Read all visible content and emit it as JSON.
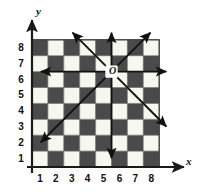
{
  "figure": {
    "axes": {
      "x_axis_label": "x",
      "y_axis_label": "y",
      "x_ticks": [
        "1",
        "2",
        "3",
        "4",
        "5",
        "6",
        "7",
        "8"
      ],
      "y_ticks": [
        "1",
        "2",
        "3",
        "4",
        "5",
        "6",
        "7",
        "8"
      ]
    },
    "origin_point": {
      "label": "O",
      "x": 5,
      "y": 6
    },
    "colors": {
      "dark_square": "#4a4a4a",
      "light_square": "#f7f7f2",
      "grid_line": "#6b6b6b",
      "axis": "#1a1a1a",
      "arrow": "#111111",
      "background": "#ffffff"
    }
  },
  "chart_data": {
    "type": "scatter",
    "xlabel": "x",
    "ylabel": "y",
    "xlim": [
      0,
      8
    ],
    "ylim": [
      0,
      8
    ],
    "grid": true,
    "x_tick_labels": [
      "1",
      "2",
      "3",
      "4",
      "5",
      "6",
      "7",
      "8"
    ],
    "y_tick_labels": [
      "1",
      "2",
      "3",
      "4",
      "5",
      "6",
      "7",
      "8"
    ],
    "legend": "none",
    "points": [
      {
        "label": "O",
        "x": 5,
        "y": 6
      }
    ],
    "checkerboard": {
      "rows": 8,
      "cols": 8,
      "dark_color": "#4a4a4a",
      "light_color": "#f7f7f2",
      "note": "column 1 of the bottom row (y=1) is dark; colors alternate by (row+col) parity",
      "dark_parity": "odd"
    },
    "arrows": [
      {
        "name": "north",
        "from": [
          5,
          6
        ],
        "to": [
          5,
          8.45
        ],
        "dx": 0,
        "dy": 1
      },
      {
        "name": "south",
        "from": [
          5,
          6
        ],
        "to": [
          5,
          0.55
        ],
        "dx": 0,
        "dy": -1
      },
      {
        "name": "east",
        "from": [
          5,
          6
        ],
        "to": [
          8.45,
          6
        ],
        "dx": 1,
        "dy": 0
      },
      {
        "name": "west",
        "from": [
          5,
          6
        ],
        "to": [
          0.55,
          6
        ],
        "dx": -1,
        "dy": 0
      },
      {
        "name": "northeast",
        "from": [
          5,
          6
        ],
        "to": [
          7.45,
          8.45
        ],
        "dx": 1,
        "dy": 1
      },
      {
        "name": "northwest",
        "from": [
          5,
          6
        ],
        "to": [
          2.55,
          8.45
        ],
        "dx": -1,
        "dy": 1
      },
      {
        "name": "southeast",
        "from": [
          5,
          6
        ],
        "to": [
          8.45,
          2.55
        ],
        "dx": 1,
        "dy": -1
      },
      {
        "name": "southwest",
        "from": [
          5,
          6
        ],
        "to": [
          0.55,
          1.55
        ],
        "dx": -1,
        "dy": -1
      }
    ]
  }
}
